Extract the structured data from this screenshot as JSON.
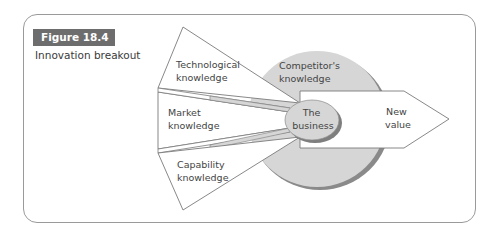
{
  "figure": {
    "number": "Figure 18.4",
    "caption": "Innovation breakout"
  },
  "diagram": {
    "inputs": [
      {
        "id": "technological",
        "line1": "Technological",
        "line2": "knowledge"
      },
      {
        "id": "market",
        "line1": "Market",
        "line2": "knowledge"
      },
      {
        "id": "capability",
        "line1": "Capability",
        "line2": "knowledge"
      }
    ],
    "context": {
      "line1": "Competitor's",
      "line2": "knowledge"
    },
    "center": {
      "line1": "The",
      "line2": "business"
    },
    "output": {
      "line1": "New",
      "line2": "value"
    },
    "colors": {
      "fill_grey": "#d6d6d6",
      "shadow_grey": "#8a8a8a",
      "stroke": "#7a7a7a",
      "badge": "#6d6d6d"
    }
  }
}
